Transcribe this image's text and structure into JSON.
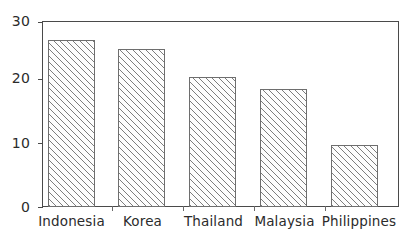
{
  "chart_data": {
    "type": "bar",
    "title": "",
    "subtitle": "",
    "xlabel": "",
    "ylabel": "",
    "categories": [
      "Indonesia",
      "Korea",
      "Thailand",
      "Malaysia",
      "Philippines"
    ],
    "values": [
      27,
      25.5,
      21,
      19,
      10
    ],
    "series": [
      {
        "name": "",
        "values": [
          27,
          25.5,
          21,
          19,
          10
        ]
      }
    ],
    "ylim": [
      0,
      30
    ],
    "yticks": [
      0,
      10,
      20,
      30
    ],
    "ytick_labels": [
      "0",
      "10",
      "20",
      "30"
    ],
    "grid": false,
    "legend": false,
    "legend_position": "none",
    "bar_fill": "hatched-diagonal",
    "bar_edge_color": "#6e6e6e",
    "bar_hatch_color": "#7d7d7d",
    "axis_color": "#4a4a4a",
    "background_color": "#ffffff",
    "annotations": []
  },
  "axes": {
    "y": {
      "ticks": [
        {
          "label": "30",
          "value": 30
        },
        {
          "label": "20",
          "value": 20
        },
        {
          "label": "10",
          "value": 10
        },
        {
          "label": "0",
          "value": 0
        }
      ]
    },
    "x": {
      "ticks": [
        {
          "label": "Indonesia"
        },
        {
          "label": "Korea"
        },
        {
          "label": "Thailand"
        },
        {
          "label": "Malaysia"
        },
        {
          "label": "Philippines"
        }
      ]
    }
  }
}
